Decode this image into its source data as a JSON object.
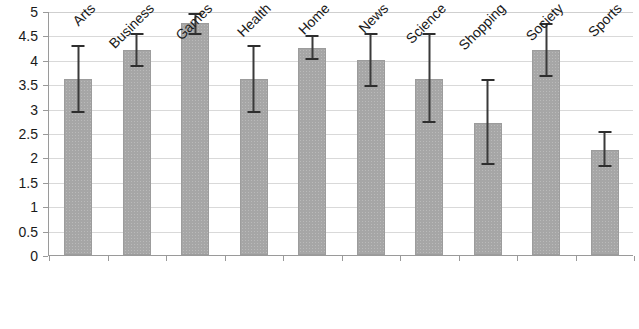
{
  "chart_data": {
    "type": "bar",
    "title": "",
    "xlabel": "",
    "ylabel": "",
    "ylim": [
      0,
      5
    ],
    "ytick_step": 0.5,
    "grid": true,
    "legend": null,
    "legend_position": "none",
    "error_bars": true,
    "bar_color": "#a6a6a6",
    "error_bar_color": "#2e2e2e",
    "gridline_color": "#d9d9d9",
    "axis_color": "#9a9a9a",
    "categories": [
      "Arts",
      "Business",
      "Games",
      "Health",
      "Home",
      "News",
      "Science",
      "Shopping",
      "Society",
      "Sports"
    ],
    "values": [
      3.6,
      4.2,
      4.75,
      3.6,
      4.25,
      4.0,
      3.6,
      2.7,
      4.2,
      2.15
    ],
    "error_low": [
      2.9,
      3.85,
      4.5,
      2.9,
      4.0,
      3.45,
      2.7,
      1.85,
      3.65,
      1.8
    ],
    "error_high": [
      4.3,
      4.55,
      4.95,
      4.3,
      4.5,
      4.55,
      4.55,
      3.6,
      4.75,
      2.55
    ],
    "ytick_labels": [
      "0",
      "0.5",
      "1",
      "1.5",
      "2",
      "2.5",
      "3",
      "3.5",
      "4",
      "4.5",
      "5"
    ],
    "ytick_values": [
      0,
      0.5,
      1,
      1.5,
      2,
      2.5,
      3,
      3.5,
      4,
      4.5,
      5
    ]
  }
}
